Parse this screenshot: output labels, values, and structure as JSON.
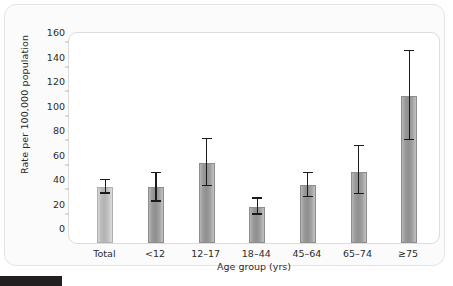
{
  "chart_data": {
    "type": "bar",
    "title": "",
    "xlabel": "Age group (yrs)",
    "ylabel": "Rate per 100,000 population",
    "categories": [
      "Total",
      "<12",
      "12–17",
      "18–44",
      "45–64",
      "65–74",
      "≥75"
    ],
    "values": [
      42.5,
      42.5,
      62,
      26,
      44,
      55,
      117
    ],
    "error_low": [
      37,
      30.5,
      43,
      20,
      34,
      36.5,
      80.5
    ],
    "error_high": [
      48,
      53.5,
      81.5,
      33,
      53.5,
      76,
      153.5
    ],
    "ylim": [
      0,
      160
    ],
    "yticks": [
      0,
      20,
      40,
      60,
      80,
      100,
      120,
      140,
      160
    ],
    "ytick_labels": [
      "0",
      "20",
      "40",
      "60",
      "80",
      "100",
      "120",
      "140",
      "160"
    ],
    "grid": false,
    "legend": "none",
    "error_bar_type": "95% confidence interval",
    "bar_colors": [
      "#bcbcbc",
      "#9a9a9a",
      "#9a9a9a",
      "#9a9a9a",
      "#9a9a9a",
      "#9a9a9a",
      "#9a9a9a"
    ],
    "error_bar_color": "#1b1b1b"
  },
  "figure": {
    "panel_background": "#fbfbfb",
    "plot_background": "#ffffff",
    "border_color": "#dcdcdc"
  }
}
